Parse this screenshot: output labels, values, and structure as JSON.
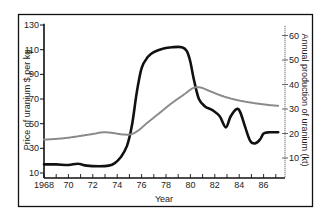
{
  "chart_data": {
    "type": "line",
    "title": "",
    "xlabel": "Year",
    "ylabel": "Price of uranium $ per kg",
    "ylabel_right": "Annual production of uranium (kt)",
    "xlim": [
      1968,
      1987.6
    ],
    "ylim": [
      6,
      132
    ],
    "ylim_right": [
      8,
      65
    ],
    "x_ticks": [
      1968,
      1969,
      1970,
      1971,
      1972,
      1973,
      1974,
      1975,
      1976,
      1977,
      1978,
      1979,
      1980,
      1981,
      1982,
      1983,
      1984,
      1985,
      1986,
      1987
    ],
    "x_tick_labels": [
      "1968",
      "70",
      "72",
      "74",
      "76",
      "78",
      "80",
      "82",
      "84",
      "86"
    ],
    "x_tick_label_years": [
      1968,
      1970,
      1972,
      1974,
      1976,
      1978,
      1980,
      1982,
      1984,
      1986
    ],
    "y_ticks_left": [
      10,
      30,
      50,
      70,
      90,
      110,
      130
    ],
    "y_ticks_right": [
      10,
      20,
      30,
      40,
      50,
      60
    ],
    "grid": false,
    "legend": "none",
    "series": [
      {
        "name": "Price of uranium ($ per kg)",
        "axis": "left",
        "style": "solid-thick",
        "x": [
          1968,
          1969,
          1970,
          1970.8,
          1971.5,
          1972.5,
          1973.3,
          1973.8,
          1974.3,
          1974.8,
          1975.2,
          1975.6,
          1976,
          1976.5,
          1977,
          1977.8,
          1978.5,
          1979.3,
          1979.7,
          1980,
          1980.3,
          1980.7,
          1981.2,
          1981.8,
          1982.4,
          1982.9,
          1983.3,
          1983.8,
          1984.1,
          1984.5,
          1984.9,
          1985.3,
          1985.7,
          1986,
          1986.5,
          1987.2
        ],
        "values": [
          17,
          17,
          16.5,
          17.5,
          16,
          15.5,
          16,
          18,
          23,
          32,
          48,
          75,
          95,
          104,
          108,
          111,
          112,
          112,
          109,
          100,
          85,
          70,
          64,
          61,
          56,
          47,
          56,
          62,
          59,
          47,
          36,
          34,
          37,
          42,
          43,
          43
        ]
      },
      {
        "name": "Annual production of uranium (kt)",
        "axis": "right",
        "style": "dotted",
        "x": [
          1968,
          1969,
          1970,
          1971,
          1972,
          1972.8,
          1973.5,
          1974.5,
          1975.2,
          1975.8,
          1976.5,
          1977.5,
          1978.5,
          1979.5,
          1980.2,
          1980.8,
          1981.5,
          1982.5,
          1983.5,
          1984.5,
          1985.5,
          1986.5,
          1987.2
        ],
        "values": [
          17.5,
          17.8,
          18.3,
          19,
          19.8,
          20.5,
          20.3,
          19.6,
          19.8,
          21.5,
          24.5,
          28.5,
          32.5,
          36,
          38.5,
          38.8,
          37.5,
          35.5,
          34,
          33,
          32.2,
          31.6,
          31.3
        ]
      }
    ]
  },
  "colors": {
    "line": "#111111",
    "dotted": "#8a8a8a",
    "frame": "#111111"
  }
}
